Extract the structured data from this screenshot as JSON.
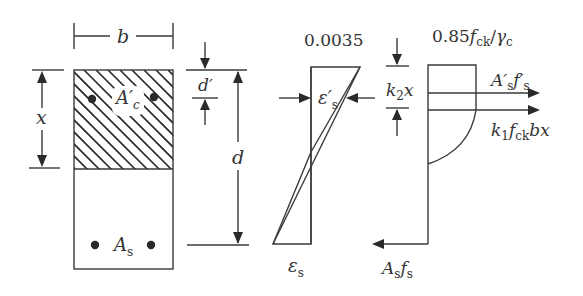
{
  "diagram": {
    "type": "reinforced-concrete-section-strain-stress",
    "colors": {
      "line": "#3a3a3a",
      "text": "#333333",
      "background": "#ffffff"
    },
    "section": {
      "width_label": "b",
      "neutral_axis_depth_label": "x",
      "compression_steel_label": "A′",
      "compression_steel_sub": "c",
      "tension_steel_label": "A",
      "tension_steel_sub": "s",
      "cover_label": "d′",
      "effective_depth_label": "d"
    },
    "strain": {
      "top_strain_label": "0.0035",
      "compression_steel_strain_label": "ε′",
      "compression_steel_strain_sub": "s",
      "tension_steel_strain_label": "ε",
      "tension_steel_strain_sub": "s"
    },
    "stress": {
      "peak_stress_label_a": "0.85",
      "peak_stress_label_f": "f",
      "peak_stress_label_ck": "ck",
      "peak_stress_label_slash": "/",
      "peak_stress_label_gamma": "γ",
      "peak_stress_label_c": "c",
      "lever_label_k": "k",
      "lever_label_2": "2",
      "lever_label_x": "x",
      "comp_steel_force_A": "A′",
      "comp_steel_force_s1": "s",
      "comp_steel_force_f": "f′",
      "comp_steel_force_s2": "s",
      "concrete_force_k": "k",
      "concrete_force_1": "1",
      "concrete_force_f": "f",
      "concrete_force_ck": "ck",
      "concrete_force_bx": "bx",
      "tension_force_A": "A",
      "tension_force_s1": "s",
      "tension_force_f": "f",
      "tension_force_s2": "s"
    }
  }
}
